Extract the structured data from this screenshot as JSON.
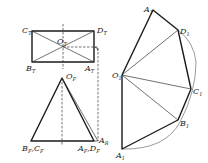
{
  "diagram": {
    "colors": {
      "line": "#1a1a1a",
      "background": "#ffffff"
    },
    "plan_view": {
      "labels": {
        "C": {
          "main": "C",
          "sub": "T"
        },
        "D": {
          "main": "D",
          "sub": "T"
        },
        "O": {
          "main": "O",
          "sub": "T"
        },
        "B": {
          "main": "B",
          "sub": "T"
        },
        "A": {
          "main": "A",
          "sub": "T"
        }
      }
    },
    "front_view": {
      "labels": {
        "O": {
          "main": "O",
          "sub": "F"
        },
        "BC": {
          "main": "B",
          "sub": "F",
          "main2": ",C",
          "sub2": "F"
        },
        "AD": {
          "main": "A",
          "sub": "F",
          "main2": ",D",
          "sub2": "F"
        },
        "AR": {
          "main": "A",
          "sub": "R"
        }
      }
    },
    "development": {
      "labels": {
        "A_top": {
          "main": "A",
          "sub": "1"
        },
        "D": {
          "main": "D",
          "sub": "1"
        },
        "O": {
          "main": "O",
          "sub": "1"
        },
        "C": {
          "main": "C",
          "sub": "1"
        },
        "B": {
          "main": "B",
          "sub": "1"
        },
        "A_bottom": {
          "main": "A",
          "sub": "1"
        }
      }
    }
  }
}
